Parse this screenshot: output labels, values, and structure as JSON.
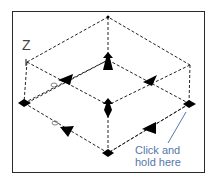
{
  "diagram": {
    "axis_label": "Z",
    "hint_line1": "Click and",
    "hint_line2": "hold here",
    "colors": {
      "frame": "#2a2a2a",
      "lines": "#222222",
      "handles": "#000000",
      "hint_text": "#5577aa",
      "hint_pointer": "#5577aa"
    }
  }
}
